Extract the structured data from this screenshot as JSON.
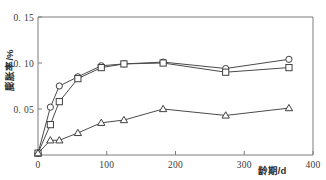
{
  "figure": {
    "caption_top": "",
    "background_color": "#ffffff",
    "line_color": "#4a4a4a",
    "axis_color": "#7d7d7d"
  },
  "chart_data": {
    "type": "line",
    "title": "",
    "xlabel": "龄期/d",
    "ylabel": "膨胀率/%",
    "xlim": [
      0,
      400
    ],
    "ylim": [
      0,
      0.15
    ],
    "grid": false,
    "legend": "none",
    "xticks": [
      0,
      100,
      200,
      300,
      400
    ],
    "xtick_labels": [
      "0",
      "100",
      "200",
      "300",
      "400"
    ],
    "yticks": [
      0.05,
      0.1,
      0.15
    ],
    "ytick_labels": [
      "0. 05",
      "0. 10",
      "0. 15"
    ],
    "x": [
      0,
      18,
      31,
      58,
      92,
      125,
      182,
      273,
      365
    ],
    "series": [
      {
        "name": "series-circle",
        "marker": "circle",
        "values": [
          0.002,
          0.052,
          0.075,
          0.085,
          0.097,
          0.099,
          0.101,
          0.094,
          0.104
        ]
      },
      {
        "name": "series-square",
        "marker": "square",
        "values": [
          0.002,
          0.033,
          0.058,
          0.083,
          0.095,
          0.099,
          0.1,
          0.09,
          0.095
        ]
      },
      {
        "name": "series-triangle",
        "marker": "triangle",
        "values": [
          0.002,
          0.016,
          0.016,
          0.024,
          0.035,
          0.038,
          0.05,
          0.043,
          0.051
        ]
      }
    ]
  }
}
